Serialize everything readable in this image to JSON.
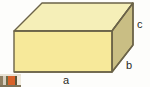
{
  "figure": {
    "name": "rectangular-box-diagram",
    "shape": "rectangular prism",
    "background_color": "#fdfdfb",
    "outline_color": "#6b6348",
    "faces": {
      "top": {
        "name": "top-face",
        "color": "#f5efb8"
      },
      "front": {
        "name": "front-face",
        "color": "#f7e99a"
      },
      "right": {
        "name": "right-face",
        "color": "#c9be84"
      }
    },
    "labels": {
      "length": "a",
      "height": "b",
      "depth": "c"
    },
    "geometry": {
      "front_top_left": [
        14,
        31
      ],
      "front_top_right": [
        112,
        31
      ],
      "front_bottom_left": [
        14,
        72
      ],
      "front_bottom_right": [
        112,
        72
      ],
      "back_top_left": [
        42,
        3
      ],
      "back_top_right": [
        133,
        3
      ],
      "back_bottom_right": [
        133,
        45
      ]
    }
  },
  "corner_thumbnail": {
    "name": "partial-image-fragment",
    "colors": [
      "#8e7f63",
      "#d8cfbe",
      "#6f6a46",
      "#d8622a",
      "#5c5438",
      "#efe9dc"
    ]
  }
}
